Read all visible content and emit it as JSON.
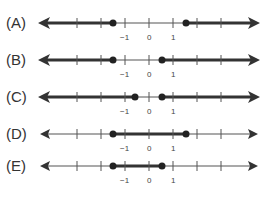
{
  "options": [
    {
      "label": "(A)",
      "left_dot": -1.5,
      "right_dot": 1.5,
      "shading": "outside"
    },
    {
      "label": "(B)",
      "left_dot": -1.5,
      "right_dot": 0.5,
      "shading": "outside"
    },
    {
      "label": "(C)",
      "left_dot": -0.5,
      "right_dot": 0.5,
      "shading": "outside"
    },
    {
      "label": "(D)",
      "left_dot": -1.5,
      "right_dot": 1.5,
      "shading": "between"
    },
    {
      "label": "(E)",
      "left_dot": -1.5,
      "right_dot": 0.5,
      "shading": "between"
    }
  ],
  "tick_labels": [
    "-1",
    "0",
    "1"
  ],
  "colors": {
    "line": "#333333",
    "dot": "#222222"
  }
}
